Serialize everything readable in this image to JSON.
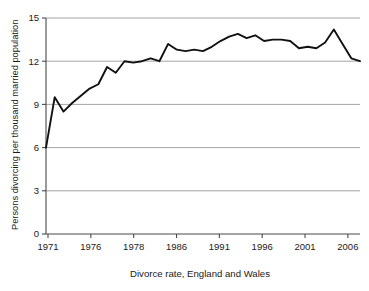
{
  "chart_data": {
    "type": "line",
    "title": "",
    "xlabel": "Divorce rate, England and Wales",
    "ylabel": "Persons divorcing per thousand married population",
    "xlim": [
      1971,
      2007
    ],
    "ylim": [
      0,
      15
    ],
    "grid": true,
    "gridlines_y": [
      3,
      6,
      9,
      12,
      15
    ],
    "legend": "none",
    "y_ticks": [
      "0",
      "3",
      "6",
      "9",
      "12",
      "15"
    ],
    "y_tick_values": [
      0,
      3,
      6,
      9,
      12,
      15
    ],
    "x_ticks": [
      "1971",
      "1976",
      "1978",
      "1986",
      "1991",
      "1996",
      "2001",
      "2006"
    ],
    "x_tick_values": [
      1971,
      1976,
      1978,
      1986,
      1991,
      1996,
      2001,
      2006
    ],
    "series": [
      {
        "name": "Divorce rate, England and Wales",
        "color": "#111111",
        "x": [
          1971,
          1972,
          1973,
          1974,
          1975,
          1976,
          1977,
          1978,
          1979,
          1980,
          1981,
          1982,
          1983,
          1984,
          1985,
          1986,
          1987,
          1988,
          1989,
          1990,
          1991,
          1992,
          1993,
          1994,
          1995,
          1996,
          1997,
          1998,
          1999,
          2000,
          2001,
          2002,
          2003,
          2004,
          2005,
          2006,
          2007
        ],
        "values": [
          6.0,
          9.5,
          8.5,
          9.1,
          9.6,
          10.1,
          10.4,
          11.6,
          11.2,
          12.0,
          11.9,
          12.0,
          12.2,
          12.0,
          13.2,
          12.8,
          12.7,
          12.8,
          12.7,
          13.0,
          13.4,
          13.7,
          13.9,
          13.6,
          13.8,
          13.4,
          13.5,
          13.5,
          13.4,
          12.9,
          13.0,
          12.9,
          13.3,
          14.2,
          13.2,
          12.2,
          12.0
        ]
      }
    ]
  }
}
